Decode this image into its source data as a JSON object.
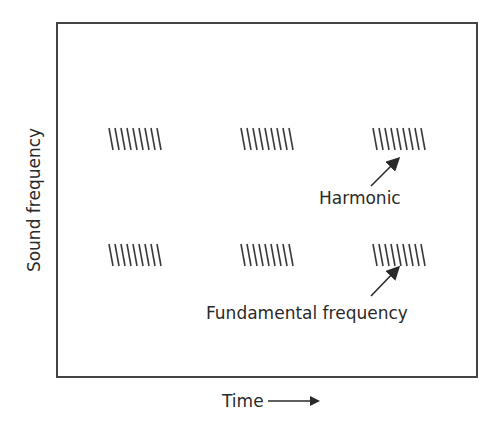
{
  "diagram": {
    "title": "",
    "frame": {
      "x": 57,
      "y": 23,
      "width": 420,
      "height": 354,
      "stroke": "#444444"
    },
    "y_axis_label": "Sound frequency",
    "x_axis_label": "Time",
    "stroke_color": "#3a3a3a",
    "hatch_groups": [
      {
        "id": "harmonic-1",
        "row": "harmonic",
        "x": 109,
        "y": 128,
        "strokes": 9
      },
      {
        "id": "harmonic-2",
        "row": "harmonic",
        "x": 241,
        "y": 128,
        "strokes": 9
      },
      {
        "id": "harmonic-3",
        "row": "harmonic",
        "x": 373,
        "y": 128,
        "strokes": 9
      },
      {
        "id": "fundamental-1",
        "row": "fundamental",
        "x": 109,
        "y": 244,
        "strokes": 9
      },
      {
        "id": "fundamental-2",
        "row": "fundamental",
        "x": 241,
        "y": 244,
        "strokes": 9
      },
      {
        "id": "fundamental-3",
        "row": "fundamental",
        "x": 373,
        "y": 244,
        "strokes": 9
      }
    ],
    "annotations": [
      {
        "id": "harmonic",
        "text": "Harmonic",
        "text_x": 319,
        "text_y": 204,
        "arrow": {
          "x1": 371,
          "y1": 186,
          "x2": 398,
          "y2": 159
        }
      },
      {
        "id": "fundamental",
        "text": "Fundamental frequency",
        "text_x": 206,
        "text_y": 319,
        "arrow": {
          "x1": 371,
          "y1": 296,
          "x2": 398,
          "y2": 268
        }
      }
    ]
  }
}
